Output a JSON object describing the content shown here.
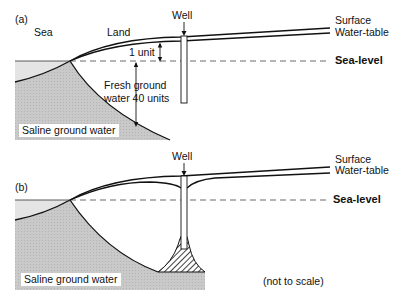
{
  "panel_a": {
    "tag": "(a)",
    "sea_label": "Sea",
    "land_label": "Land",
    "well_label": "Well",
    "surface_label": "Surface",
    "water_table_label": "Water-table",
    "sea_level_label": "Sea-level",
    "unit_label": "1 unit",
    "fresh_label_line1": "Fresh ground",
    "fresh_label_line2": "water 40 units",
    "saline_label": "Saline ground water"
  },
  "panel_b": {
    "tag": "(b)",
    "well_label": "Well",
    "surface_label": "Surface",
    "water_table_label": "Water-table",
    "sea_level_label": "Sea-level",
    "saline_label": "Saline ground water",
    "note": "(not to scale)"
  },
  "colors": {
    "saline_fill": "#c8c8c8",
    "sea_fill": "#e2e2e2",
    "line": "#111111"
  }
}
